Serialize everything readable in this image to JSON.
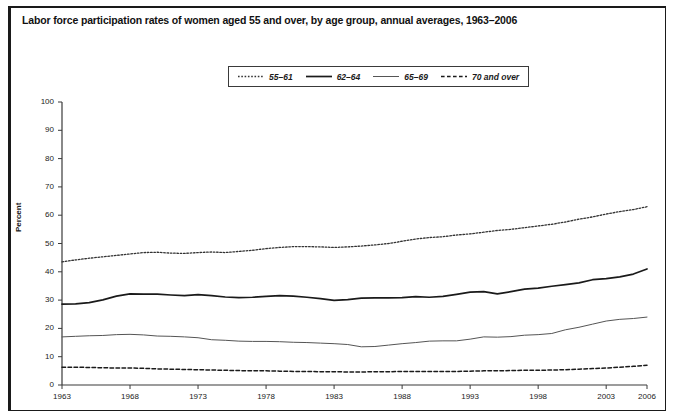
{
  "figure": {
    "title": "Labor force participation rates of women aged 55 and over, by age group, annual averages, 1963–2006",
    "ylabel": "Percent"
  },
  "legend": {
    "position": "top-center",
    "items": [
      {
        "label": "55–61",
        "style": "dotted"
      },
      {
        "label": "62–64",
        "style": "solid-thick"
      },
      {
        "label": "65–69",
        "style": "solid-thin"
      },
      {
        "label": "70 and over",
        "style": "dashed"
      }
    ]
  },
  "axes": {
    "y_ticks": [
      "0",
      "10",
      "20",
      "30",
      "40",
      "50",
      "60",
      "70",
      "80",
      "90",
      "100"
    ],
    "x_ticks": [
      "1963",
      "1968",
      "1973",
      "1978",
      "1983",
      "1988",
      "1993",
      "1998",
      "2003",
      "2006"
    ]
  },
  "chart_data": {
    "type": "line",
    "title": "Labor force participation rates of women aged 55 and over, by age group, annual averages, 1963–2006",
    "xlabel": "",
    "ylabel": "Percent",
    "xlim": [
      1963,
      2006
    ],
    "ylim": [
      0,
      100
    ],
    "grid": false,
    "legend_position": "top-center",
    "x": [
      1963,
      1964,
      1965,
      1966,
      1967,
      1968,
      1969,
      1970,
      1971,
      1972,
      1973,
      1974,
      1975,
      1976,
      1977,
      1978,
      1979,
      1980,
      1981,
      1982,
      1983,
      1984,
      1985,
      1986,
      1987,
      1988,
      1989,
      1990,
      1991,
      1992,
      1993,
      1994,
      1995,
      1996,
      1997,
      1998,
      1999,
      2000,
      2001,
      2002,
      2003,
      2004,
      2005,
      2006
    ],
    "series": [
      {
        "name": "55–61",
        "style": "dotted",
        "color": "#333333",
        "values": [
          43.5,
          44.2,
          44.8,
          45.3,
          45.8,
          46.3,
          46.8,
          46.9,
          46.6,
          46.5,
          46.8,
          47.0,
          46.8,
          47.2,
          47.6,
          48.2,
          48.6,
          48.9,
          48.9,
          48.8,
          48.6,
          48.8,
          49.1,
          49.5,
          50.0,
          50.8,
          51.6,
          52.1,
          52.4,
          53.0,
          53.4,
          54.0,
          54.6,
          55.0,
          55.6,
          56.2,
          56.8,
          57.6,
          58.6,
          59.4,
          60.4,
          61.3,
          62.0,
          63.0
        ]
      },
      {
        "name": "62–64",
        "style": "solid-thick",
        "color": "#1a1a1a",
        "values": [
          28.6,
          28.7,
          29.1,
          30.1,
          31.4,
          32.2,
          32.1,
          32.1,
          31.8,
          31.6,
          31.9,
          31.6,
          31.1,
          30.9,
          31.0,
          31.3,
          31.6,
          31.4,
          31.0,
          30.5,
          29.9,
          30.2,
          30.7,
          30.8,
          30.8,
          30.9,
          31.2,
          31.0,
          31.3,
          32.0,
          32.8,
          33.0,
          32.2,
          33.0,
          33.9,
          34.2,
          34.9,
          35.5,
          36.1,
          37.2,
          37.6,
          38.2,
          39.2,
          41.0
        ]
      },
      {
        "name": "65–69",
        "style": "solid-thin",
        "color": "#555555",
        "values": [
          17.0,
          17.2,
          17.4,
          17.5,
          17.8,
          17.9,
          17.7,
          17.3,
          17.2,
          17.0,
          16.7,
          16.0,
          15.8,
          15.5,
          15.4,
          15.4,
          15.3,
          15.1,
          15.0,
          14.8,
          14.6,
          14.3,
          13.5,
          13.6,
          14.1,
          14.6,
          15.0,
          15.5,
          15.6,
          15.6,
          16.2,
          17.0,
          16.9,
          17.1,
          17.6,
          17.8,
          18.2,
          19.5,
          20.4,
          21.5,
          22.6,
          23.2,
          23.5,
          24.0
        ]
      },
      {
        "name": "70 and over",
        "style": "dashed",
        "color": "#1a1a1a",
        "values": [
          6.3,
          6.3,
          6.2,
          6.1,
          6.0,
          6.0,
          5.9,
          5.7,
          5.6,
          5.5,
          5.4,
          5.3,
          5.2,
          5.1,
          5.0,
          5.0,
          4.9,
          4.8,
          4.8,
          4.7,
          4.7,
          4.6,
          4.6,
          4.7,
          4.7,
          4.8,
          4.8,
          4.8,
          4.8,
          4.8,
          4.9,
          5.0,
          5.0,
          5.1,
          5.2,
          5.2,
          5.3,
          5.4,
          5.6,
          5.8,
          6.0,
          6.3,
          6.6,
          7.0
        ]
      }
    ]
  }
}
